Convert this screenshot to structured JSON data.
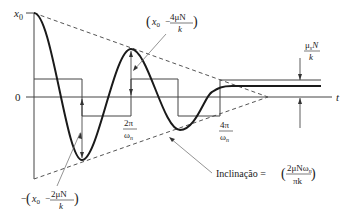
{
  "diagram": {
    "axes": {
      "y_top_label": "x",
      "y_top_sub": "0",
      "zero_label": "0",
      "t_label": "t"
    },
    "annotations": {
      "peak2": {
        "open": "(",
        "x": "x",
        "sub": "0",
        "minus": "−",
        "num": "4μN",
        "den": "k",
        "close": ")"
      },
      "trough1": {
        "neg": "−",
        "open": "(",
        "x": "x",
        "sub": "0",
        "minus": "−",
        "num": "2μN",
        "den": "k",
        "close": ")"
      },
      "period1": {
        "num": "2π",
        "den": "ω",
        "den_sub": "n"
      },
      "period2": {
        "num": "4π",
        "den": "ω",
        "den_sub": "n"
      },
      "static_band": {
        "num_mu": "μ",
        "num_sub": "s",
        "num_rest": "N",
        "den": "k"
      },
      "slope": {
        "label": "Inclinação = ",
        "open": "(",
        "num": "2μNω",
        "num_sub": "n",
        "den": "πk",
        "close": ")"
      }
    },
    "colors": {
      "curve": "#1a1a1a",
      "lines": "#444444",
      "dashed": "#555555",
      "text": "#222222"
    }
  }
}
